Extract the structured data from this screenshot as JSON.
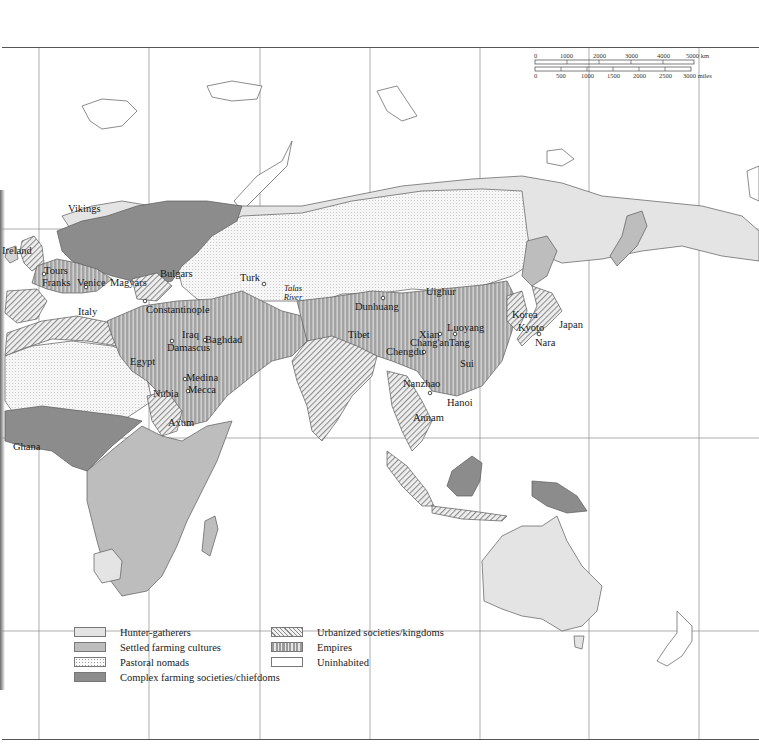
{
  "scale_bar": {
    "km_ticks": [
      "0",
      "1000",
      "2000",
      "3000",
      "4000",
      "5000 km"
    ],
    "mile_ticks": [
      "0",
      "500",
      "1000",
      "1500",
      "2000",
      "2500",
      "3000 miles"
    ]
  },
  "legend": {
    "left": [
      {
        "label": "Hunter-gatherers",
        "swatch": "hunter"
      },
      {
        "label": "Settled farming cultures",
        "swatch": "settled"
      },
      {
        "label": "Pastoral nomads",
        "swatch": "pastoral"
      },
      {
        "label": "Complex farming societies/chiefdoms",
        "swatch": "complex"
      }
    ],
    "right": [
      {
        "label": "Urbanized societies/kingdoms",
        "swatch": "urban"
      },
      {
        "label": "Empires",
        "swatch": "empire"
      },
      {
        "label": "Uninhabited",
        "swatch": "uninhabited"
      }
    ]
  },
  "colors": {
    "hunter_gatherers": "#e4e4e4",
    "settled_farming": "#bdbdbd",
    "pastoral_nomads": "#f4f4f4",
    "complex_farming": "#8c8c8c",
    "urbanized": "#d8d8d8",
    "empires": "#a8a8a8",
    "uninhabited": "#ffffff",
    "graticule": "#888888",
    "coast": "#555555"
  },
  "labels": {
    "vikings": "Vikings",
    "ireland": "Ireland",
    "tours": "Tours",
    "franks": "Franks",
    "venice": "Venice",
    "magyars": "Magyars",
    "bulgars": "Bulgars",
    "italy": "Italy",
    "constantinople": "Constantinople",
    "iraq": "Iraq",
    "baghdad": "Baghdad",
    "damascus": "Damascus",
    "egypt": "Egypt",
    "medina": "Medina",
    "mecca": "Mecca",
    "nubia": "Nubia",
    "axum": "Axum",
    "ghana": "Ghana",
    "turk": "Turk",
    "talas_river": "Talas River",
    "dunhuang": "Dunhuang",
    "uighur": "Uighur",
    "tibet": "Tibet",
    "xian": "Xian",
    "changan": "Chang'an",
    "luoyang": "Luoyang",
    "tang": "Tang",
    "chengdu": "Chengdu",
    "sui": "Sui",
    "nanzhao": "Nanzhao",
    "hanoi": "Hanoi",
    "annam": "Annam",
    "korea": "Korea",
    "kyoto": "Kyoto",
    "nara": "Nara",
    "japan": "Japan"
  }
}
